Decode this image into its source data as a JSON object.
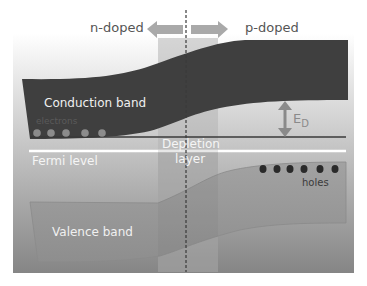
{
  "diagram": {
    "type": "pn-junction band diagram",
    "labels": {
      "n_side": "n-doped",
      "p_side": "p-doped",
      "conduction_band": "Conduction band",
      "electrons": "electrons",
      "fermi_level": "Fermi level",
      "depletion_line1": "Depletion",
      "depletion_line2": "layer",
      "ed_symbol": "E",
      "ed_subscript": "D",
      "holes": "holes",
      "valence_band": "Valence band"
    },
    "electron_count": 5,
    "hole_count": 6,
    "colors": {
      "conduction_band": "#3f3f3f",
      "valence_band": "#9a9a9a",
      "fermi_line": "#ffffff",
      "depletion_region": "#a8a8a8",
      "arrows": "#a9a9a9",
      "electrons": "#8c8c8c",
      "holes": "#2a2a2a",
      "text_light": "#f2f2f2",
      "text_dark": "#4a4a4a"
    }
  }
}
